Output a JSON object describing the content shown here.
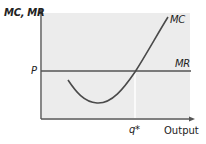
{
  "diagram": {
    "type": "economics-cost-revenue",
    "y_axis_label": "MC, MR",
    "x_axis_label": "Output",
    "price_label": "P",
    "quantity_label": "q*",
    "curves": [
      {
        "name": "MC",
        "label": "MC",
        "shape": "U-shaped marginal cost curve"
      },
      {
        "name": "MR",
        "label": "MR",
        "shape": "horizontal line at price P"
      }
    ],
    "colors": {
      "plot_fill": "#ececec",
      "axis": "#555555",
      "curve": "#4a4a4a",
      "q_star_line": "#ffffff"
    }
  }
}
